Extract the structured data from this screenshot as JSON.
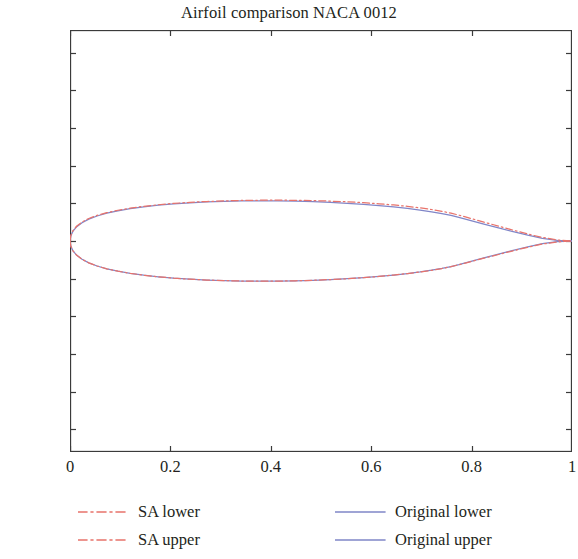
{
  "chart_data": {
    "type": "line",
    "title": "Airfoil comparison NACA 0012",
    "xlabel": "",
    "ylabel": "",
    "xlim": [
      0,
      1.0
    ],
    "ylim": [
      -0.28,
      0.28
    ],
    "grid": false,
    "legend_position": "below-axes",
    "xticks": [
      0,
      0.2,
      0.4,
      0.6,
      0.8,
      1
    ],
    "xticklabels": [
      "0",
      "0.2",
      "0.4",
      "0.6",
      "0.8",
      "1"
    ],
    "yticks": [
      0.25,
      0.2,
      0.15,
      0.1,
      0.05,
      0,
      -0.05,
      -0.1,
      -0.15,
      -0.2,
      -0.25
    ],
    "yticklabels": [
      "0.25",
      "0.2",
      "0.15",
      "0.1",
      "0.05",
      "0",
      "−0.05",
      "−0.1",
      "−0.15",
      "−0.2",
      "−0.25"
    ],
    "colors": {
      "sa": "#e8736b",
      "original": "#8086c8",
      "axis": "#3b3b3b",
      "text": "#231f20"
    },
    "series": [
      {
        "name": "SA lower",
        "style": "dashdot",
        "color": "#e8736b",
        "x": [
          0,
          0.0015,
          0.006,
          0.0135,
          0.024,
          0.0375,
          0.054,
          0.0733,
          0.0954,
          0.12,
          0.1469,
          0.1759,
          0.2066,
          0.2389,
          0.2725,
          0.307,
          0.3422,
          0.3778,
          0.4135,
          0.4491,
          0.4843,
          0.5188,
          0.5524,
          0.5847,
          0.6156,
          0.6448,
          0.6721,
          0.6973,
          0.7203,
          0.7409,
          0.759,
          0.7746,
          0.7876,
          0.8005,
          0.8245,
          0.8536,
          0.8827,
          0.9119,
          0.941,
          0.9705,
          1.0
        ],
        "y": [
          0,
          -0.0067,
          -0.0131,
          -0.019,
          -0.0243,
          -0.029,
          -0.0332,
          -0.0369,
          -0.0401,
          -0.0429,
          -0.0454,
          -0.0475,
          -0.0493,
          -0.0507,
          -0.0518,
          -0.0526,
          -0.0531,
          -0.0533,
          -0.0532,
          -0.0528,
          -0.0521,
          -0.0512,
          -0.05,
          -0.0486,
          -0.047,
          -0.0452,
          -0.0432,
          -0.0411,
          -0.0389,
          -0.0365,
          -0.034,
          -0.0315,
          -0.0293,
          -0.027,
          -0.0228,
          -0.0179,
          -0.013,
          -0.0083,
          -0.0041,
          -0.0012,
          0
        ]
      },
      {
        "name": "SA upper",
        "style": "dashdot",
        "color": "#e8736b",
        "x": [
          0,
          0.0015,
          0.006,
          0.0135,
          0.024,
          0.0375,
          0.054,
          0.0733,
          0.0954,
          0.12,
          0.1469,
          0.1759,
          0.2066,
          0.2389,
          0.2725,
          0.307,
          0.3422,
          0.3778,
          0.4135,
          0.4491,
          0.4843,
          0.5188,
          0.5524,
          0.5847,
          0.6156,
          0.6448,
          0.6721,
          0.6973,
          0.7203,
          0.7409,
          0.759,
          0.7746,
          0.7876,
          0.8005,
          0.8245,
          0.8536,
          0.8827,
          0.9119,
          0.941,
          0.9705,
          1.0
        ],
        "y": [
          0,
          0.0071,
          0.0139,
          0.0199,
          0.0252,
          0.0299,
          0.034,
          0.0376,
          0.0408,
          0.0436,
          0.046,
          0.0481,
          0.0499,
          0.0513,
          0.0524,
          0.0532,
          0.0538,
          0.0541,
          0.0542,
          0.054,
          0.0536,
          0.0529,
          0.052,
          0.0508,
          0.0494,
          0.0478,
          0.046,
          0.044,
          0.0418,
          0.0394,
          0.0369,
          0.0343,
          0.032,
          0.0296,
          0.0251,
          0.0197,
          0.0144,
          0.0093,
          0.0047,
          0.0014,
          0
        ]
      },
      {
        "name": "Original lower",
        "style": "solid",
        "color": "#8086c8",
        "x": [
          0,
          0.0015,
          0.006,
          0.0135,
          0.024,
          0.0375,
          0.054,
          0.0733,
          0.0954,
          0.12,
          0.1469,
          0.1759,
          0.2066,
          0.2389,
          0.2725,
          0.307,
          0.3422,
          0.3778,
          0.4135,
          0.4491,
          0.4843,
          0.5188,
          0.5524,
          0.5847,
          0.6156,
          0.6448,
          0.6721,
          0.6973,
          0.7203,
          0.7409,
          0.759,
          0.7746,
          0.7876,
          0.8005,
          0.8245,
          0.8536,
          0.8827,
          0.9119,
          0.941,
          0.9705,
          1.0
        ],
        "y": [
          0,
          -0.0067,
          -0.0131,
          -0.019,
          -0.0243,
          -0.029,
          -0.0332,
          -0.0369,
          -0.0401,
          -0.0429,
          -0.0454,
          -0.0475,
          -0.0493,
          -0.0507,
          -0.0518,
          -0.0526,
          -0.0531,
          -0.0533,
          -0.0532,
          -0.0528,
          -0.0521,
          -0.0512,
          -0.05,
          -0.0486,
          -0.047,
          -0.0452,
          -0.0432,
          -0.0411,
          -0.0388,
          -0.0364,
          -0.0339,
          -0.0314,
          -0.0291,
          -0.0268,
          -0.0224,
          -0.0174,
          -0.0124,
          -0.0077,
          -0.0036,
          -0.0009,
          0
        ]
      },
      {
        "name": "Original upper",
        "style": "solid",
        "color": "#8086c8",
        "x": [
          0,
          0.0015,
          0.006,
          0.0135,
          0.024,
          0.0375,
          0.054,
          0.0733,
          0.0954,
          0.12,
          0.1469,
          0.1759,
          0.2066,
          0.2389,
          0.2725,
          0.307,
          0.3422,
          0.3778,
          0.4135,
          0.4491,
          0.4843,
          0.5188,
          0.5524,
          0.5847,
          0.6156,
          0.6448,
          0.6721,
          0.6973,
          0.7203,
          0.7409,
          0.759,
          0.7746,
          0.7876,
          0.8005,
          0.8245,
          0.8536,
          0.8827,
          0.9119,
          0.941,
          0.9705,
          1.0
        ],
        "y": [
          0,
          0.0067,
          0.0131,
          0.019,
          0.0243,
          0.029,
          0.0332,
          0.0369,
          0.0401,
          0.0429,
          0.0454,
          0.0475,
          0.0493,
          0.0507,
          0.0518,
          0.0526,
          0.0531,
          0.0533,
          0.0532,
          0.0528,
          0.0521,
          0.0512,
          0.05,
          0.0486,
          0.047,
          0.0452,
          0.0432,
          0.0411,
          0.0388,
          0.0364,
          0.0339,
          0.0314,
          0.0291,
          0.0268,
          0.0224,
          0.0174,
          0.0124,
          0.0077,
          0.0036,
          0.0009,
          0
        ]
      }
    ]
  },
  "legend": {
    "entries": [
      {
        "label": "SA lower",
        "color": "#e8736b",
        "style": "dashdot"
      },
      {
        "label": "SA upper",
        "color": "#e8736b",
        "style": "dashdot"
      },
      {
        "label": "Original lower",
        "color": "#8086c8",
        "style": "solid"
      },
      {
        "label": "Original upper",
        "color": "#8086c8",
        "style": "solid"
      }
    ]
  }
}
